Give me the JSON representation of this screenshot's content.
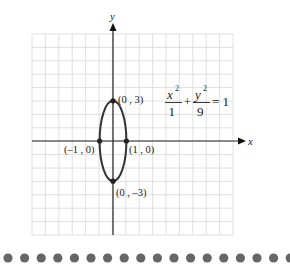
{
  "chart_data": {
    "type": "line",
    "title": "",
    "equation": {
      "numerator_left": "x",
      "exp_left": "2",
      "denominator_left": "1",
      "plus": "+",
      "numerator_right": "y",
      "exp_right": "2",
      "denominator_right": "9",
      "equals": "= 1"
    },
    "xlabel": "x",
    "ylabel": "y",
    "xlim": [
      -6,
      9
    ],
    "ylim": [
      -7,
      8
    ],
    "grid": true,
    "ellipse": {
      "cx": 0,
      "cy": 0,
      "a": 1,
      "b": 3
    },
    "points": [
      {
        "x": 0,
        "y": 3,
        "label": "(0 , 3)"
      },
      {
        "x": 0,
        "y": -3,
        "label": "(0 , –3)"
      },
      {
        "x": -1,
        "y": 0,
        "label": "(–1 , 0)"
      },
      {
        "x": 1,
        "y": 0,
        "label": "(1 , 0)"
      }
    ]
  },
  "colors": {
    "grid": "#d8d8d8",
    "axis": "#222222",
    "curve": "#333333",
    "dots": "#666666"
  },
  "footer": {
    "dot_count": 18
  }
}
